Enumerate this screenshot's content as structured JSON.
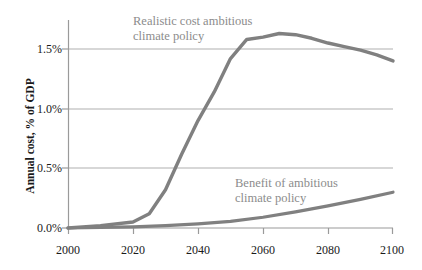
{
  "chart_data": {
    "type": "line",
    "title": "",
    "xlabel": "",
    "ylabel": "Annual cost, % of GDP",
    "xlim": [
      2000,
      2100
    ],
    "ylim": [
      0.0,
      1.75
    ],
    "xticks": [
      2000,
      2020,
      2040,
      2060,
      2080,
      2100
    ],
    "xtick_labels": [
      "2000",
      "2020",
      "2040",
      "2060",
      "2080",
      "2100"
    ],
    "yticks": [
      0.0,
      0.5,
      1.0,
      1.5
    ],
    "ytick_labels": [
      "0.0%",
      "0.5%",
      "1.0%",
      "1.5%"
    ],
    "grid": "horizontal",
    "legend_position": "inline-annotations",
    "line_color": "#808080",
    "grid_color": "#b3b3b3",
    "axis_color": "#8c8c8c",
    "text_color": "#1a1a1a",
    "annotation_color": "#8c8c8c",
    "series": [
      {
        "name": "Realistic cost ambitious climate policy",
        "annotation": "Realistic cost ambitious\nclimate policy",
        "x": [
          2000,
          2010,
          2020,
          2025,
          2030,
          2035,
          2040,
          2045,
          2050,
          2055,
          2060,
          2065,
          2070,
          2075,
          2080,
          2085,
          2090,
          2095,
          2100
        ],
        "values": [
          0.0,
          0.02,
          0.05,
          0.12,
          0.32,
          0.62,
          0.9,
          1.14,
          1.42,
          1.58,
          1.6,
          1.63,
          1.62,
          1.59,
          1.55,
          1.52,
          1.49,
          1.45,
          1.4
        ]
      },
      {
        "name": "Benefit of ambitious climate policy",
        "annotation": "Benefit of ambitious\nclimate policy",
        "x": [
          2000,
          2010,
          2020,
          2030,
          2040,
          2050,
          2060,
          2070,
          2080,
          2090,
          2100
        ],
        "values": [
          0.0,
          0.005,
          0.01,
          0.02,
          0.035,
          0.055,
          0.09,
          0.135,
          0.185,
          0.24,
          0.3
        ]
      }
    ]
  }
}
